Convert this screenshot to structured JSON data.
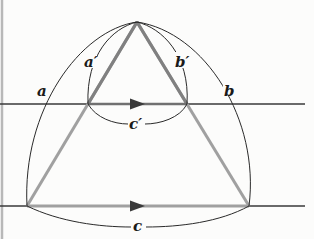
{
  "figure": {
    "type": "geometric-diagram",
    "colors": {
      "background": "#fcfcfb",
      "lines": "#3a3a3a",
      "triangle": "#9a9a9a",
      "small_triangle": "#7a7a7a",
      "arcs": "#2a2a2a",
      "labels": "#1a1a1a",
      "border": "#b8b8b8"
    },
    "points": {
      "apex": [
        137,
        22
      ],
      "upper_left": [
        88,
        104
      ],
      "upper_right": [
        187,
        104
      ],
      "lower_left": [
        27,
        206
      ],
      "lower_right": [
        249,
        206
      ]
    },
    "lines": {
      "upper": {
        "y": 104,
        "x_start": 0,
        "x_end": 305
      },
      "lower": {
        "y": 206,
        "x_start": 0,
        "x_end": 305
      }
    },
    "labels": {
      "a_prime": "a′",
      "b_prime": "b′",
      "a": "a",
      "b": "b",
      "c_prime": "c′",
      "c": "c"
    }
  }
}
